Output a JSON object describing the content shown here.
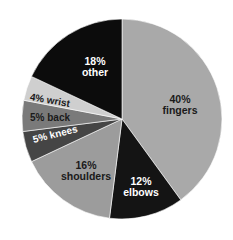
{
  "chart_data": {
    "type": "pie",
    "title": "",
    "start_angle_deg_clockwise_from_top": 0,
    "slices": [
      {
        "label": "fingers",
        "value": 40,
        "color": "#a9a9a9",
        "text_color": "#1a1a1a"
      },
      {
        "label": "elbows",
        "value": 12,
        "color": "#141414",
        "text_color": "#ffffff"
      },
      {
        "label": "shoulders",
        "value": 16,
        "color": "#9c9c9c",
        "text_color": "#1a1a1a"
      },
      {
        "label": "knees",
        "value": 5,
        "color": "#454545",
        "text_color": "#ffffff"
      },
      {
        "label": "back",
        "value": 5,
        "color": "#7a7a7a",
        "text_color": "#1a1a1a"
      },
      {
        "label": "wrist",
        "value": 4,
        "color": "#cfcfcf",
        "text_color": "#1a1a1a"
      },
      {
        "label": "other",
        "value": 18,
        "color": "#0c0c0c",
        "text_color": "#ffffff"
      }
    ]
  },
  "labels": {
    "fingers": {
      "pct": "40%",
      "name": "fingers"
    },
    "elbows": {
      "pct": "12%",
      "name": "elbows"
    },
    "shoulders": {
      "pct": "16%",
      "name": "shoulders"
    },
    "knees": "5% knees",
    "back": "5% back",
    "wrist": "4% wrist",
    "other": {
      "pct": "18%",
      "name": "other"
    }
  }
}
